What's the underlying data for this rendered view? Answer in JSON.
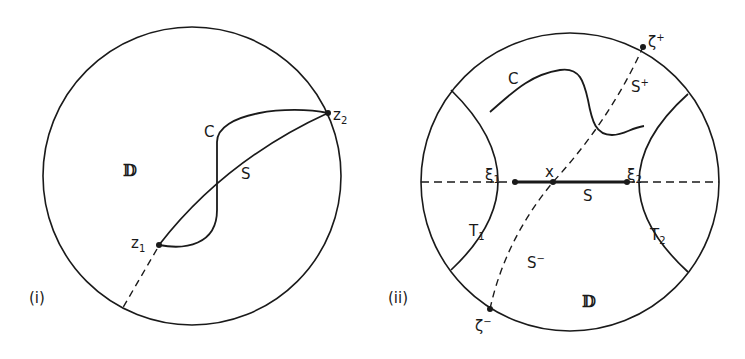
{
  "figure": {
    "panels": [
      {
        "id": "i",
        "caption": "(i)",
        "disk_label": "𝔻",
        "points": [
          {
            "name": "z",
            "sub": "1"
          },
          {
            "name": "z",
            "sub": "2"
          }
        ],
        "curve_labels": {
          "C": "C",
          "S": "S"
        }
      },
      {
        "id": "ii",
        "caption": "(ii)",
        "disk_label": "𝔻",
        "points": [
          {
            "name": "ξ",
            "sub": "1"
          },
          {
            "name": "ξ",
            "sub": "2"
          },
          {
            "name": "x"
          },
          {
            "name": "ζ",
            "sup": "+"
          },
          {
            "name": "ζ",
            "sup": "−"
          }
        ],
        "curve_labels": {
          "C": "C",
          "S": "S",
          "S_plus": "S",
          "S_plus_sup": "+",
          "S_minus": "S",
          "S_minus_sup": "−"
        },
        "regions": [
          {
            "name": "T",
            "sub": "1"
          },
          {
            "name": "T",
            "sub": "2"
          }
        ]
      }
    ],
    "colors": {
      "ink": "#1a1a1a",
      "background": "#ffffff"
    }
  }
}
